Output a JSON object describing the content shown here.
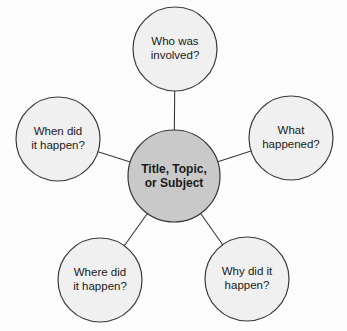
{
  "diagram": {
    "type": "web-cluster-diagram",
    "title_node": {
      "id": "hub",
      "label": "Title, Topic,\nor Subject",
      "fill": "#c9c9c9",
      "stroke": "#3a3a3a",
      "cx": 174,
      "cy": 176,
      "r": 46
    },
    "satellites": [
      {
        "id": "who",
        "label": "Who was\ninvolved?",
        "name": "circle-who-was-involved",
        "fill": "#f0f0f0",
        "stroke": "#3a3a3a",
        "cx": 175,
        "cy": 49,
        "r": 42
      },
      {
        "id": "what",
        "label": "What\nhappened?",
        "name": "circle-what-happened",
        "fill": "#f0f0f0",
        "stroke": "#3a3a3a",
        "cx": 291,
        "cy": 138,
        "r": 42
      },
      {
        "id": "why",
        "label": "Why did it\nhappen?",
        "name": "circle-why-did-it-happen",
        "fill": "#f0f0f0",
        "stroke": "#3a3a3a",
        "cx": 247,
        "cy": 279,
        "r": 42
      },
      {
        "id": "where",
        "label": "Where did\nit happen?",
        "name": "circle-where-did-it-happen",
        "fill": "#f0f0f0",
        "stroke": "#3a3a3a",
        "cx": 100,
        "cy": 280,
        "r": 42
      },
      {
        "id": "when",
        "label": "When did\nit happen?",
        "name": "circle-when-did-it-happen",
        "fill": "#f0f0f0",
        "stroke": "#3a3a3a",
        "cx": 58,
        "cy": 139,
        "r": 42
      }
    ],
    "connectors": [
      {
        "id": "hub-who",
        "from": "hub",
        "to": "who"
      },
      {
        "id": "hub-what",
        "from": "hub",
        "to": "what"
      },
      {
        "id": "hub-why",
        "from": "hub",
        "to": "why"
      },
      {
        "id": "hub-where",
        "from": "hub",
        "to": "where"
      },
      {
        "id": "hub-when",
        "from": "hub",
        "to": "when"
      }
    ],
    "connector_color": "#3a3a3a",
    "background": "#fdfdfd"
  }
}
